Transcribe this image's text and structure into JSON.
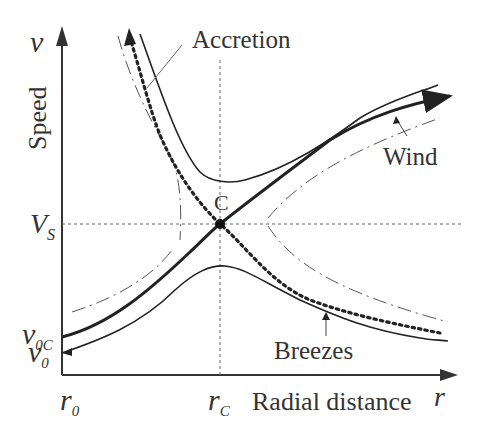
{
  "diagram": {
    "type": "solution-curves",
    "axes": {
      "y_label": "Speed",
      "y_symbol": "v",
      "x_label": "Radial distance",
      "x_symbol": "r"
    },
    "y_ticks": [
      {
        "main": "V",
        "sub": "S"
      },
      {
        "main": "v",
        "sub": "0C"
      },
      {
        "main": "v",
        "sub": "0"
      }
    ],
    "x_ticks": [
      {
        "main": "r",
        "sub": "0"
      },
      {
        "main": "r",
        "sub": "C"
      }
    ],
    "critical_point": "C",
    "annotations": {
      "accretion": "Accretion",
      "wind": "Wind",
      "breezes": "Breezes"
    },
    "curves": [
      {
        "name": "wind (transonic, thick solid, rising)"
      },
      {
        "name": "accretion (thick dotted, falling)"
      },
      {
        "name": "breeze (thin solid, subsonic, peaks at rC)"
      },
      {
        "name": "upper branch (thin solid, minimum at rC)"
      },
      {
        "name": "outer dash-dot curves (non-physical branches)"
      }
    ]
  }
}
